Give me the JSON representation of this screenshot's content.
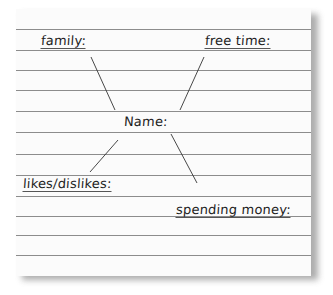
{
  "worksheet": {
    "center": "Name:",
    "branches": [
      {
        "label": "family:"
      },
      {
        "label": "free time:"
      },
      {
        "label": "likes/dislikes:"
      },
      {
        "label": "spending money:"
      }
    ]
  },
  "colors": {
    "paper": "#fbfbfb",
    "rule": "#8c8c8c",
    "ink": "#1e1e1e"
  }
}
